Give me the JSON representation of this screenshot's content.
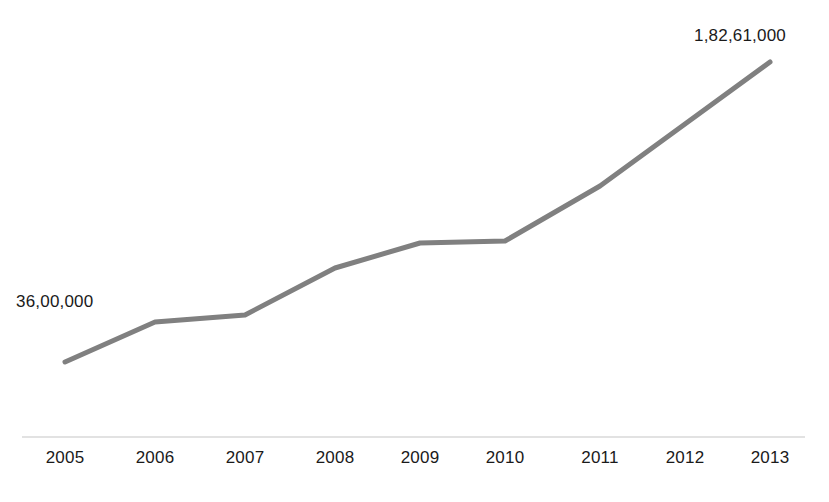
{
  "chart_data": {
    "type": "line",
    "title": "",
    "subtitle": "",
    "xlabel": "",
    "ylabel": "",
    "grid": false,
    "legend": "none",
    "categories": [
      "2005",
      "2006",
      "2007",
      "2008",
      "2009",
      "2010",
      "2011",
      "2012",
      "2013"
    ],
    "x": [
      2005,
      2006,
      2007,
      2008,
      2009,
      2010,
      2011,
      2012,
      2013
    ],
    "series": [
      {
        "name": "",
        "values": [
          3600000,
          6200000,
          6650000,
          9700000,
          11300000,
          11450000,
          15000000,
          18900000,
          18261000
        ],
        "value_labels": [
          "36,00,000",
          "",
          "",
          "",
          "",
          "",
          "",
          "",
          "1,82,61,000"
        ],
        "color": "#808080"
      }
    ],
    "pixel_points": [
      {
        "category": "2005",
        "x": 65,
        "y": 362
      },
      {
        "category": "2006",
        "x": 155,
        "y": 322
      },
      {
        "category": "2007",
        "x": 245,
        "y": 315
      },
      {
        "category": "2008",
        "x": 335,
        "y": 268
      },
      {
        "category": "2009",
        "x": 420,
        "y": 243
      },
      {
        "category": "2010",
        "x": 505,
        "y": 241
      },
      {
        "category": "2011",
        "x": 600,
        "y": 186
      },
      {
        "category": "2012",
        "x": 685,
        "y": 124
      },
      {
        "category": "2013",
        "x": 770,
        "y": 62
      }
    ],
    "annotations": [
      {
        "name": "start-value",
        "text": "36,00,000",
        "anchor_category": "2005"
      },
      {
        "name": "end-value",
        "text": "1,82,61,000",
        "anchor_category": "2013"
      }
    ],
    "xlim": [
      2005,
      2013
    ],
    "axis": {
      "x_axis_line_color": "#d9d9d9",
      "x_axis_line_y": 437,
      "x_axis_line_x_start": 22,
      "x_axis_line_x_end": 805,
      "y_axis_visible": false
    },
    "style": {
      "background": "#ffffff",
      "line_color": "#808080",
      "line_width": 5,
      "text_color": "#1a1a1a"
    }
  },
  "labels": {
    "start_value": "36,00,000",
    "end_value": "1,82,61,000"
  }
}
